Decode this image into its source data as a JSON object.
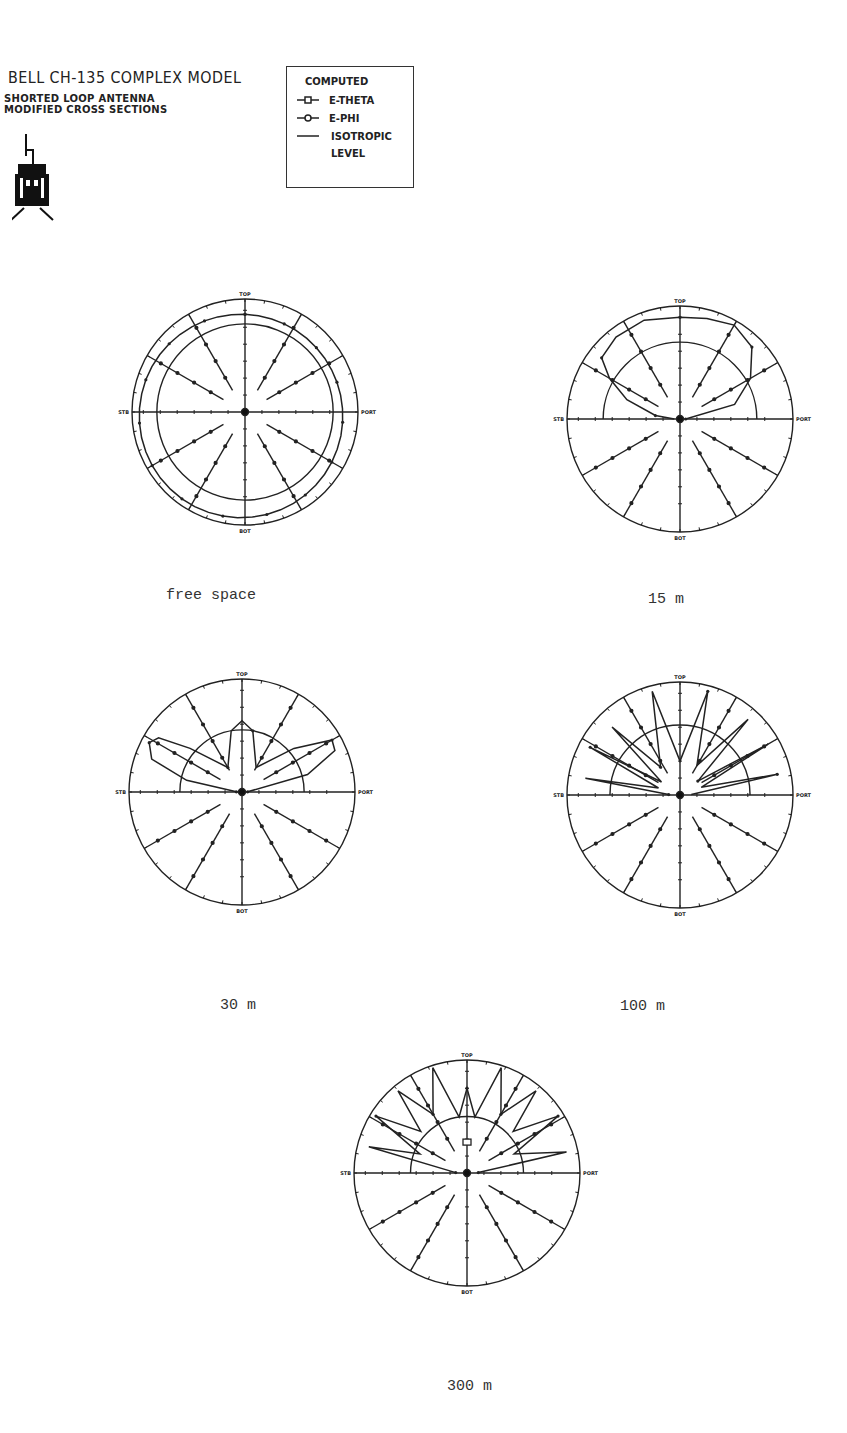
{
  "header": {
    "title": "BELL CH-135 COMPLEX MODEL",
    "subtitle_line1": "SHORTED LOOP ANTENNA",
    "subtitle_line2": "MODIFIED CROSS SECTIONS"
  },
  "legend": {
    "heading": "COMPUTED",
    "items": [
      {
        "label": "E-THETA",
        "marker": "square"
      },
      {
        "label": "E-PHI",
        "marker": "circle"
      },
      {
        "label": "ISOTROPIC",
        "marker": "none"
      },
      {
        "label": "LEVEL",
        "marker": "none"
      }
    ]
  },
  "axis_labels": {
    "top": "TOP",
    "bottom": "BOT",
    "left": "STB",
    "right": "PORT"
  },
  "captions": {
    "free_space": "free space",
    "m15": "15 m",
    "m30": "30 m",
    "m100": "100 m",
    "m300": "300 m"
  },
  "chart_data": [
    {
      "type": "polar",
      "title": "free space",
      "angle_labels": [
        "TOP",
        "PORT",
        "BOT",
        "STB"
      ],
      "spokes_deg": [
        0,
        30,
        60,
        90,
        120,
        150,
        180,
        210,
        240,
        270,
        300,
        330
      ],
      "isotropic_level": {
        "shape": "full circle",
        "radius_rel": 0.78
      },
      "series": [
        {
          "name": "E-PHI",
          "description": "near-circular pattern at ~0.9 of outer radius, slightly offset toward bottom-right",
          "radius_rel_approx": 0.9
        }
      ]
    },
    {
      "type": "polar",
      "title": "15 m",
      "angle_labels": [
        "TOP",
        "PORT",
        "BOT",
        "STB"
      ],
      "isotropic_level": {
        "shape": "upper half circle",
        "radius_rel": 0.7
      },
      "series": [
        {
          "name": "E-PHI",
          "description": "single large upper-hemisphere lobe, flattened at top near 0.9 radius, tilted toward STB"
        }
      ]
    },
    {
      "type": "polar",
      "title": "30 m",
      "angle_labels": [
        "TOP",
        "PORT",
        "BOT",
        "STB"
      ],
      "isotropic_level": {
        "shape": "upper half circle",
        "radius_rel": 0.55
      },
      "series": [
        {
          "name": "E-PHI",
          "description": "two low-elevation lobes toward STB and PORT (~20-25 deg above horizon) reaching ~0.9 radius, plus small narrow lobe near TOP ~0.6 radius"
        }
      ]
    },
    {
      "type": "polar",
      "title": "100 m",
      "angle_labels": [
        "TOP",
        "PORT",
        "BOT",
        "STB"
      ],
      "isotropic_level": {
        "shape": "upper half circle",
        "radius_rel": 0.62
      },
      "series": [
        {
          "name": "E-PHI",
          "description": "many narrow lobes fanning across the upper hemisphere, several reaching outer circle"
        }
      ]
    },
    {
      "type": "polar",
      "title": "300 m",
      "angle_labels": [
        "TOP",
        "PORT",
        "BOT",
        "STB"
      ],
      "isotropic_level": {
        "shape": "upper half circle",
        "radius_rel": 0.5
      },
      "series": [
        {
          "name": "E-PHI",
          "description": "multiple spiky lobes in upper hemisphere reaching near outer circle, narrow lobe at TOP"
        },
        {
          "name": "E-THETA",
          "description": "small marker near center-top"
        }
      ]
    }
  ]
}
